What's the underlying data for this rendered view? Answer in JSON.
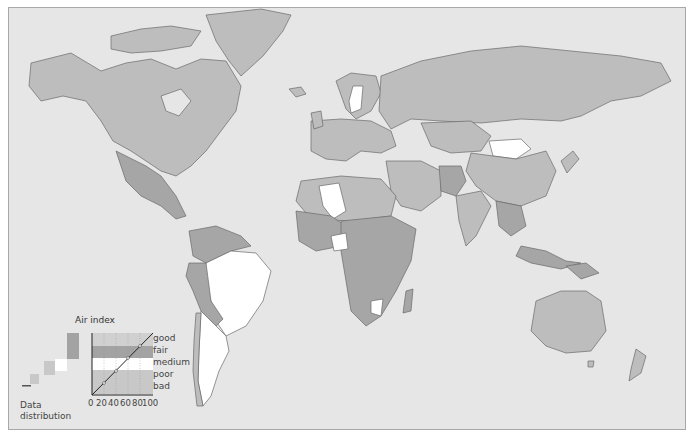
{
  "map": {
    "ocean_color": "#e6e6e6",
    "border_color": "#6a6a6a",
    "category_colors": {
      "good": "#c4c4c4",
      "fair": "#a3a3a3",
      "medium": "#ffffff",
      "poor": "#c4c4c4",
      "bad": "#c4c4c4"
    },
    "regions": [
      {
        "name": "North America",
        "fill": "#bdbdbd",
        "d": "M30,62 L70,52 L100,70 L125,62 L150,58 L175,68 L200,58 L225,60 L240,85 L235,110 L220,130 L205,150 L190,165 L175,175 L160,170 L145,160 L130,150 L112,140 L100,120 L85,100 L62,95 L40,100 L28,85 Z"
      },
      {
        "name": "Canadian Arctic",
        "fill": "#bdbdbd",
        "d": "M110,35 L140,28 L170,25 L200,30 L190,45 L160,50 L130,52 L110,48 Z"
      },
      {
        "name": "Hudson Bay",
        "fill": "#e6e6e6",
        "d": "M160,95 L180,88 L190,100 L178,115 L165,110 Z"
      },
      {
        "name": "Greenland",
        "fill": "#bdbdbd",
        "d": "M205,14 L260,8 L290,14 L282,30 L262,55 L240,75 L228,60 L215,40 Z"
      },
      {
        "name": "Central America",
        "fill": "#a6a6a6",
        "d": "M115,150 L145,165 L160,175 L175,195 L185,215 L175,218 L160,205 L140,195 L125,180 Z"
      },
      {
        "name": "South America North",
        "fill": "#a6a6a6",
        "d": "M188,230 L215,225 L240,235 L250,245 L230,250 L205,262 L192,255 Z"
      },
      {
        "name": "Brazil",
        "fill": "#ffffff",
        "d": "M205,262 L230,250 L255,252 L270,270 L262,300 L245,325 L225,335 L215,320 L210,300 L202,285 Z"
      },
      {
        "name": "Peru Bolivia",
        "fill": "#a6a6a6",
        "d": "M188,262 L205,262 L210,300 L222,318 L215,325 L200,310 L192,290 L185,275 Z"
      },
      {
        "name": "Southern Cone",
        "fill": "#ffffff",
        "d": "M200,310 L215,325 L225,335 L228,350 L218,370 L210,395 L202,405 L197,380 L198,350 Z"
      },
      {
        "name": "Chile",
        "fill": "#bdbdbd",
        "d": "M195,312 L200,312 L198,350 L197,380 L202,405 L196,405 L192,370 L193,340 Z"
      },
      {
        "name": "Iceland",
        "fill": "#bdbdbd",
        "d": "M288,88 L300,86 L305,93 L295,96 Z"
      },
      {
        "name": "Scandinavia",
        "fill": "#bdbdbd",
        "d": "M335,80 L350,72 L375,75 L380,92 L370,110 L355,118 L345,108 Z"
      },
      {
        "name": "Sweden",
        "fill": "#ffffff",
        "d": "M352,85 L362,85 L360,108 L350,112 L348,100 Z"
      },
      {
        "name": "Europe",
        "fill": "#bdbdbd",
        "d": "M310,120 L340,118 L370,120 L390,130 L395,145 L380,152 L360,150 L345,160 L325,158 L310,150 Z"
      },
      {
        "name": "UK",
        "fill": "#bdbdbd",
        "d": "M310,112 L320,110 L322,125 L313,128 Z"
      },
      {
        "name": "Russia",
        "fill": "#bdbdbd",
        "d": "M380,75 L420,60 L470,50 L520,45 L570,50 L620,55 L660,62 L670,80 L640,95 L610,100 L580,115 L560,120 L520,118 L480,122 L440,120 L410,118 L390,128 L378,110 Z"
      },
      {
        "name": "Kazakhstan",
        "fill": "#bdbdbd",
        "d": "M420,122 L470,120 L490,135 L480,150 L450,152 L430,145 Z"
      },
      {
        "name": "Mongolia",
        "fill": "#ffffff",
        "d": "M488,140 L520,138 L530,148 L515,158 L492,155 Z"
      },
      {
        "name": "China",
        "fill": "#bdbdbd",
        "d": "M470,152 L492,155 L515,158 L545,150 L555,170 L545,195 L520,205 L495,200 L475,185 L465,170 Z"
      },
      {
        "name": "Middle East",
        "fill": "#bdbdbd",
        "d": "M385,160 L420,160 L440,170 L440,195 L420,210 L400,205 L390,190 Z"
      },
      {
        "name": "Afghanistan Pakistan",
        "fill": "#a6a6a6",
        "d": "M438,165 L460,165 L465,180 L455,195 L440,190 Z"
      },
      {
        "name": "India",
        "fill": "#bdbdbd",
        "d": "M455,195 L480,190 L490,205 L475,235 L465,245 L458,220 Z"
      },
      {
        "name": "Southeast Asia",
        "fill": "#a6a6a6",
        "d": "M495,200 L520,205 L525,225 L510,235 L498,225 Z"
      },
      {
        "name": "North Africa",
        "fill": "#bdbdbd",
        "d": "M300,180 L340,175 L380,178 L395,195 L390,215 L350,220 L310,218 L295,200 Z"
      },
      {
        "name": "Algeria",
        "fill": "#ffffff",
        "d": "M318,185 L338,182 L345,210 L332,218 L322,205 Z"
      },
      {
        "name": "West Africa",
        "fill": "#a6a6a6",
        "d": "M295,210 L330,215 L345,225 L340,245 L315,250 L298,240 Z"
      },
      {
        "name": "Central Africa",
        "fill": "#a6a6a6",
        "d": "M340,220 L390,215 L415,228 L410,260 L395,290 L380,315 L365,325 L350,310 L345,280 L340,250 Z"
      },
      {
        "name": "Nigeria region",
        "fill": "#ffffff",
        "d": "M330,235 L345,232 L347,248 L333,250 Z"
      },
      {
        "name": "Southern Africa white",
        "fill": "#ffffff",
        "d": "M370,300 L382,298 L380,315 L370,312 Z"
      },
      {
        "name": "Madagascar",
        "fill": "#a6a6a6",
        "d": "M405,290 L412,288 L410,310 L402,312 Z"
      },
      {
        "name": "Indonesia",
        "fill": "#a6a6a6",
        "d": "M520,245 L545,250 L565,260 L580,262 L560,268 L530,262 L515,255 Z"
      },
      {
        "name": "New Guinea",
        "fill": "#a6a6a6",
        "d": "M565,265 L585,262 L598,272 L580,278 Z"
      },
      {
        "name": "Japan",
        "fill": "#bdbdbd",
        "d": "M560,160 L572,150 L578,158 L566,172 Z"
      },
      {
        "name": "Australia",
        "fill": "#bdbdbd",
        "d": "M535,300 L560,290 L585,290 L600,300 L605,330 L590,350 L565,352 L545,345 L530,330 Z"
      },
      {
        "name": "Tasmania",
        "fill": "#bdbdbd",
        "d": "M587,360 L593,360 L592,366 L587,366 Z"
      },
      {
        "name": "New Zealand",
        "fill": "#bdbdbd",
        "d": "M635,348 L645,355 L640,372 L628,380 L630,368 Z"
      }
    ]
  },
  "legend": {
    "title": "Air index",
    "categories": [
      "good",
      "fair",
      "medium",
      "poor",
      "bad"
    ],
    "x_ticks": [
      "0",
      "20",
      "40",
      "60",
      "80",
      "100"
    ],
    "data_distribution_label_line1": "Data",
    "data_distribution_label_line2": "distribution",
    "band_colors": {
      "good": "#d0d0d0",
      "fair": "#a3a3a3",
      "medium": "#ffffff",
      "poor": "#c8c8c8",
      "bad": "#c8c8c8"
    }
  },
  "caption": ""
}
